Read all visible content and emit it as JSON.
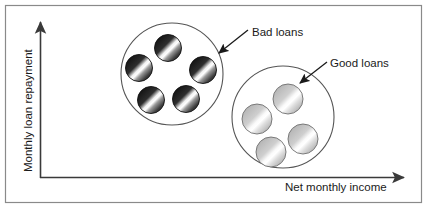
{
  "figure": {
    "title_visible": false,
    "background_color": "#ffffff",
    "frame": {
      "name": "outer-border",
      "color": "#8a8a8a",
      "x": 5,
      "y": 5,
      "width": 417,
      "height": 198
    }
  },
  "axes": {
    "line_color": "#3a3a3a",
    "origin": {
      "x": 40,
      "y": 178
    },
    "y_axis": {
      "label": "Monthly loan repayment",
      "top_y": 20,
      "arrow": "up-arrow-icon"
    },
    "x_axis": {
      "label": "Net monthly income",
      "right_x": 408,
      "arrow": "right-arrow-icon"
    }
  },
  "clusters": [
    {
      "id": "bad-loans",
      "label": "Bad loans",
      "label_x": 252,
      "label_y": 36,
      "circle": {
        "cx": 172,
        "cy": 74,
        "r": 51
      },
      "circle_stroke": "#555555",
      "point_fill_dark": "#1e1e1e",
      "point_fill_light": "#ffffff",
      "point_radius": 13.5,
      "point_count": 5,
      "points": [
        {
          "cx": 168,
          "cy": 48
        },
        {
          "cx": 139,
          "cy": 68
        },
        {
          "cx": 203,
          "cy": 70
        },
        {
          "cx": 151,
          "cy": 100
        },
        {
          "cx": 186,
          "cy": 99
        }
      ],
      "callout": {
        "name": "bad-loans-callout-arrow",
        "x1": 248,
        "y1": 30,
        "x2": 218,
        "y2": 54
      }
    },
    {
      "id": "good-loans",
      "label": "Good loans",
      "label_x": 330,
      "label_y": 67,
      "circle": {
        "cx": 283,
        "cy": 117,
        "r": 51
      },
      "circle_stroke": "#555555",
      "point_fill_dark": "#b5b5b5",
      "point_fill_light": "#ffffff",
      "point_radius": 15,
      "point_count": 4,
      "points": [
        {
          "cx": 288,
          "cy": 99
        },
        {
          "cx": 257,
          "cy": 119
        },
        {
          "cx": 271,
          "cy": 152
        },
        {
          "cx": 303,
          "cy": 139
        }
      ],
      "callout": {
        "name": "good-loans-callout-arrow",
        "x1": 327,
        "y1": 62,
        "x2": 299,
        "y2": 84
      }
    }
  ]
}
